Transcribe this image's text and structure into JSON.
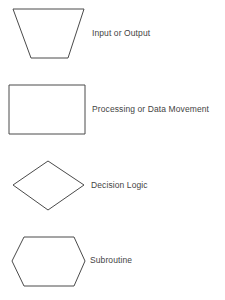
{
  "diagram": {
    "type": "flowchart-symbol-legend",
    "symbols": [
      {
        "id": "input-output",
        "shape": "trapezoid",
        "label": "Input or Output",
        "points": [
          [
            13,
            9
          ],
          [
            84,
            9
          ],
          [
            68,
            58
          ],
          [
            31,
            58
          ]
        ]
      },
      {
        "id": "processing",
        "shape": "rectangle",
        "label": "Processing or Data Movement",
        "points": [
          [
            9,
            85
          ],
          [
            85,
            85
          ],
          [
            85,
            134
          ],
          [
            9,
            134
          ]
        ]
      },
      {
        "id": "decision",
        "shape": "diamond",
        "label": "Decision Logic",
        "points": [
          [
            48,
            161
          ],
          [
            84,
            185
          ],
          [
            48,
            210
          ],
          [
            13,
            185
          ]
        ]
      },
      {
        "id": "subroutine",
        "shape": "hexagon",
        "label": "Subroutine",
        "points": [
          [
            24,
            237
          ],
          [
            74,
            237
          ],
          [
            85,
            261
          ],
          [
            74,
            286
          ],
          [
            24,
            286
          ],
          [
            12,
            261
          ]
        ]
      }
    ],
    "colors": {
      "stroke": "#4a4a4a",
      "text": "#444444",
      "background": "#ffffff"
    }
  }
}
